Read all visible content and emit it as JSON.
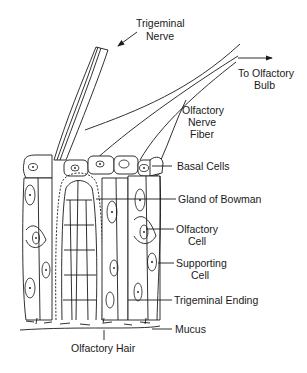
{
  "figure": {
    "colors": {
      "line": "#1a1a1a",
      "background": "#ffffff"
    }
  },
  "labels": {
    "trigeminal_nerve": [
      "Trigeminal",
      "Nerve"
    ],
    "to_olfactory_bulb": [
      "To Olfactory",
      "Bulb"
    ],
    "olfactory_nerve_fiber": [
      "Olfactory",
      "Nerve",
      "Fiber"
    ],
    "basal_cells": "Basal Cells",
    "gland_of_bowman": "Gland of Bowman",
    "olfactory_cell": [
      "Olfactory",
      "Cell"
    ],
    "supporting_cell": [
      "Supporting",
      "Cell"
    ],
    "trigeminal_ending": "Trigeminal Ending",
    "mucus": "Mucus",
    "olfactory_hair": "Olfactory Hair"
  }
}
